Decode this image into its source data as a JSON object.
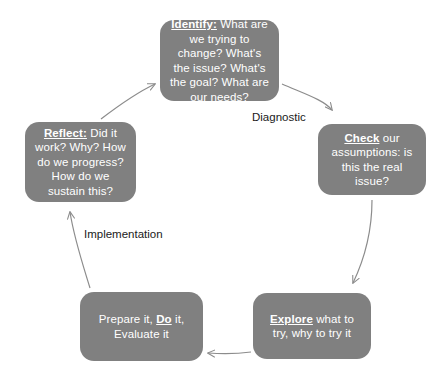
{
  "diagram": {
    "type": "cycle",
    "title": "",
    "node_fill_color": "#808080",
    "node_text_color": "#ffffff",
    "arrow_color": "#8c8c8c",
    "label_color": "#1a1a1a",
    "nodes": [
      {
        "id": "identify",
        "position": "top",
        "lead": "Identify:",
        "body": " What are we trying to change? What's the issue? What's the goal? What are our needs?"
      },
      {
        "id": "check",
        "position": "right",
        "lead": "Check",
        "body": " our assumptions: is this the real issue?"
      },
      {
        "id": "explore",
        "position": "bottom-right",
        "lead": "Explore",
        "body": " what to try, why to try it"
      },
      {
        "id": "do",
        "position": "bottom-left",
        "pre": "Prepare it, ",
        "lead": "Do",
        "body": " it, Evaluate it"
      },
      {
        "id": "reflect",
        "position": "left",
        "lead": "Reflect:",
        "body": " Did it work? Why? How do we progress? How do we sustain this?"
      }
    ],
    "phase_labels": [
      {
        "id": "diagnostic",
        "text": "Diagnostic"
      },
      {
        "id": "implementation",
        "text": "Implementation"
      }
    ],
    "arrows": [
      {
        "id": "identify-to-check",
        "from": "identify",
        "to": "check"
      },
      {
        "id": "check-to-explore",
        "from": "check",
        "to": "explore"
      },
      {
        "id": "explore-to-do",
        "from": "explore",
        "to": "do"
      },
      {
        "id": "do-to-reflect",
        "from": "do",
        "to": "reflect"
      },
      {
        "id": "reflect-to-identify",
        "from": "reflect",
        "to": "identify"
      }
    ]
  }
}
